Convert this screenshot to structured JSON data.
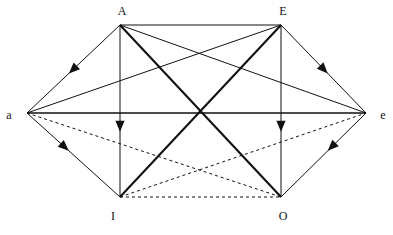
{
  "diagram": {
    "width": 393,
    "height": 235,
    "background": "#ffffff",
    "stroke_color": "#111111",
    "vertices": [
      {
        "id": "A",
        "label": "A",
        "x": 120,
        "y": 25,
        "label_x": 122,
        "label_y": 11
      },
      {
        "id": "E",
        "label": "E",
        "x": 281,
        "y": 25,
        "label_x": 283,
        "label_y": 11
      },
      {
        "id": "a",
        "label": "a",
        "x": 27,
        "y": 113,
        "label_x": 9,
        "label_y": 115
      },
      {
        "id": "e",
        "label": "e",
        "x": 366,
        "y": 113,
        "label_x": 383,
        "label_y": 115
      },
      {
        "id": "I",
        "label": "I",
        "x": 120,
        "y": 197,
        "label_x": 113,
        "label_y": 216
      },
      {
        "id": "O",
        "label": "O",
        "x": 281,
        "y": 197,
        "label_x": 283,
        "label_y": 216
      }
    ],
    "edges": [
      {
        "name": "edge-A-E",
        "from": "A",
        "to": "E",
        "style": "solid",
        "width": 1,
        "arrow": "none"
      },
      {
        "name": "edge-a-e",
        "from": "a",
        "to": "e",
        "style": "solid",
        "width": 1.4,
        "arrow": "none"
      },
      {
        "name": "edge-I-O",
        "from": "I",
        "to": "O",
        "style": "dashed",
        "width": 1,
        "arrow": "none"
      },
      {
        "name": "edge-A-a",
        "from": "A",
        "to": "a",
        "style": "solid",
        "width": 1,
        "arrow": "mid"
      },
      {
        "name": "edge-E-e",
        "from": "E",
        "to": "e",
        "style": "solid",
        "width": 1,
        "arrow": "mid"
      },
      {
        "name": "edge-a-I",
        "from": "a",
        "to": "I",
        "style": "solid",
        "width": 1,
        "arrow": "mid"
      },
      {
        "name": "edge-e-O",
        "from": "e",
        "to": "O",
        "style": "solid",
        "width": 1,
        "arrow": "mid"
      },
      {
        "name": "edge-A-I",
        "from": "A",
        "to": "I",
        "style": "solid",
        "width": 1,
        "arrow": "mid"
      },
      {
        "name": "edge-E-O",
        "from": "E",
        "to": "O",
        "style": "solid",
        "width": 1,
        "arrow": "mid"
      },
      {
        "name": "edge-a-E",
        "from": "a",
        "to": "E",
        "style": "solid",
        "width": 1,
        "arrow": "none"
      },
      {
        "name": "edge-A-e",
        "from": "A",
        "to": "e",
        "style": "solid",
        "width": 1,
        "arrow": "none"
      },
      {
        "name": "edge-A-O",
        "from": "A",
        "to": "O",
        "style": "solid",
        "width": 2.1,
        "arrow": "none"
      },
      {
        "name": "edge-E-I",
        "from": "E",
        "to": "I",
        "style": "solid",
        "width": 2.1,
        "arrow": "none"
      },
      {
        "name": "edge-a-O",
        "from": "a",
        "to": "O",
        "style": "dashed",
        "width": 1,
        "arrow": "none"
      },
      {
        "name": "edge-I-e",
        "from": "I",
        "to": "e",
        "style": "dashed",
        "width": 1,
        "arrow": "none"
      }
    ],
    "arrow_positions": {
      "edge-A-a": 0.55,
      "edge-E-e": 0.55,
      "edge-a-I": 0.45,
      "edge-e-O": 0.45,
      "edge-A-I": 0.62,
      "edge-E-O": 0.62
    },
    "dash_pattern": "3,3"
  }
}
